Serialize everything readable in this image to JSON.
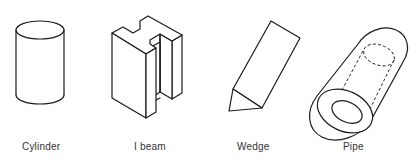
{
  "figure": {
    "shapes": [
      {
        "id": "cylinder",
        "label": "Cylinder"
      },
      {
        "id": "ibeam",
        "label": "I beam"
      },
      {
        "id": "wedge",
        "label": "Wedge"
      },
      {
        "id": "pipe",
        "label": "Pipe"
      }
    ],
    "colors": {
      "line": "#1a1a1a",
      "background": "#ffffff",
      "label": "#333333"
    }
  }
}
